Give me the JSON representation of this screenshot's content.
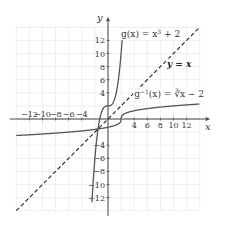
{
  "chart_data": {
    "type": "line",
    "title": "",
    "xlabel": "x",
    "ylabel": "y",
    "xlim": [
      -14,
      14
    ],
    "ylim": [
      -14,
      14
    ],
    "grid": true,
    "grid_step": 2,
    "x_ticks": [
      -12,
      -10,
      -8,
      -6,
      -4,
      4,
      6,
      8,
      10,
      12
    ],
    "y_ticks": [
      12,
      10,
      8,
      6,
      4,
      -4,
      -6,
      -8,
      -10,
      -12
    ],
    "x_tick_labels": [
      "−12",
      "−10",
      "−8",
      "−6",
      "−4",
      "4",
      "6",
      "8",
      "10",
      "12"
    ],
    "y_tick_labels": [
      "12",
      "10",
      "8",
      "6",
      "4",
      "−4",
      "−6",
      "−8",
      "−10",
      "−12"
    ],
    "series": [
      {
        "name": "g(x) = x³ + 2",
        "function": "x^3 + 2",
        "style": "solid",
        "color": "#555555"
      },
      {
        "name": "g⁻¹(x) = ∛(x − 2)",
        "function": "cbrt(x - 2)",
        "style": "solid",
        "color": "#555555"
      },
      {
        "name": "y = x",
        "function": "x",
        "style": "dashed",
        "color": "#222222"
      }
    ],
    "annotations": [
      {
        "text_main": "g(x) = x",
        "text_sup": "3",
        "text_tail": " + 2",
        "x": 2,
        "y": 12.5
      },
      {
        "text": "y = x",
        "x": 9,
        "y": 8,
        "bold": true
      },
      {
        "text_main": "g",
        "text_sup": "−1",
        "text_tail": "(x) = ∛x − 2",
        "x": 4,
        "y": 3.3
      }
    ]
  }
}
